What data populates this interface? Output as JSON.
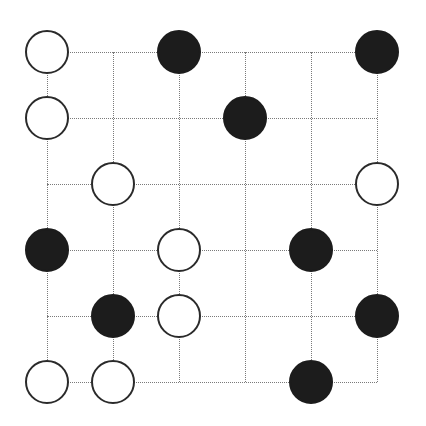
{
  "puzzle": {
    "type": "masyu",
    "rows": 6,
    "cols": 6,
    "grid_x": [
      47,
      113,
      179,
      245,
      311,
      377
    ],
    "grid_y": [
      52,
      118,
      184,
      250,
      316,
      382
    ],
    "colors": {
      "line": "#7a7a7a",
      "white_border": "#2a2a2a",
      "black_fill": "#1c1c1c",
      "background": "#ffffff"
    },
    "pearls": [
      {
        "row": 0,
        "col": 0,
        "color": "white"
      },
      {
        "row": 0,
        "col": 2,
        "color": "black"
      },
      {
        "row": 0,
        "col": 5,
        "color": "black"
      },
      {
        "row": 1,
        "col": 0,
        "color": "white"
      },
      {
        "row": 1,
        "col": 3,
        "color": "black"
      },
      {
        "row": 2,
        "col": 1,
        "color": "white"
      },
      {
        "row": 2,
        "col": 5,
        "color": "white"
      },
      {
        "row": 3,
        "col": 0,
        "color": "black"
      },
      {
        "row": 3,
        "col": 2,
        "color": "white"
      },
      {
        "row": 3,
        "col": 4,
        "color": "black"
      },
      {
        "row": 4,
        "col": 1,
        "color": "black"
      },
      {
        "row": 4,
        "col": 2,
        "color": "white"
      },
      {
        "row": 4,
        "col": 5,
        "color": "black"
      },
      {
        "row": 5,
        "col": 0,
        "color": "white"
      },
      {
        "row": 5,
        "col": 1,
        "color": "white"
      },
      {
        "row": 5,
        "col": 4,
        "color": "black"
      }
    ]
  }
}
